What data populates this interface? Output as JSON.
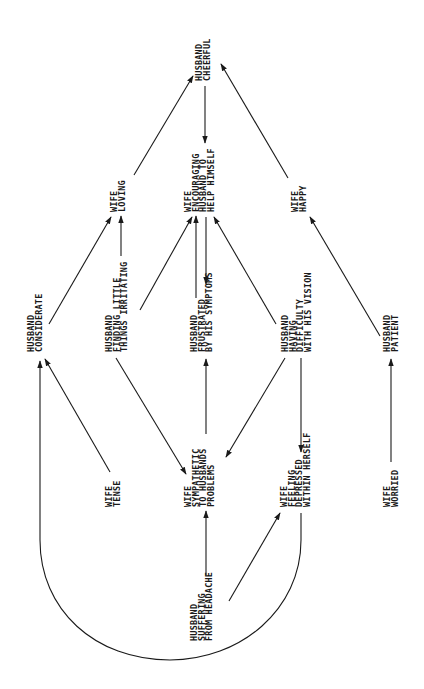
{
  "diagram": {
    "orientation": "rotated-90",
    "nodes": {
      "husband_cheerful": {
        "lines": [
          "HUSBAND",
          "CHEERFUL"
        ]
      },
      "wife_loving": {
        "lines": [
          "WIFE",
          "LOVING"
        ]
      },
      "wife_encouraging": {
        "lines": [
          "WIFE",
          "ENCOURAGING",
          "HUSBAND TO",
          "HELP HIMSELF"
        ]
      },
      "wife_happy": {
        "lines": [
          "WIFE",
          "HAPPY"
        ]
      },
      "husband_considerate": {
        "lines": [
          "HUSBAND",
          "CONSIDERATE"
        ]
      },
      "husband_finding": {
        "lines": [
          "HUSBAND",
          "FINDING LITTLE",
          "THINGS IRRITATING"
        ]
      },
      "husband_frustrated": {
        "lines": [
          "HUSBAND",
          "FRUSTRATED",
          "BY HIS SYMPTOMS"
        ]
      },
      "husband_having": {
        "lines": [
          "HUSBAND",
          "HAVING",
          "DIFFICULTY",
          "WITH HIS VISION"
        ]
      },
      "husband_patient": {
        "lines": [
          "HUSBAND",
          "PATIENT"
        ]
      },
      "wife_tense": {
        "lines": [
          "WIFE",
          "TENSE"
        ]
      },
      "wife_sympathetic": {
        "lines": [
          "WIFE",
          "SYMPATHETIC",
          "TO HUSBANDS",
          "PROBLEMS"
        ]
      },
      "wife_feeling": {
        "lines": [
          "WIFE",
          "FEELING",
          "DEPRESSED",
          "WITHIN HERSELF"
        ]
      },
      "wife_worried": {
        "lines": [
          "WIFE",
          "WORRIED"
        ]
      },
      "husband_suffering": {
        "lines": [
          "HUSBAND",
          "SUFFERING",
          "FROM HEADACHE"
        ]
      }
    },
    "edges": [
      {
        "from": "wife_loving",
        "to": "husband_cheerful"
      },
      {
        "from": "husband_cheerful",
        "to": "wife_encouraging"
      },
      {
        "from": "wife_happy",
        "to": "husband_cheerful"
      },
      {
        "from": "husband_considerate",
        "to": "wife_loving"
      },
      {
        "from": "husband_finding",
        "to": "wife_loving"
      },
      {
        "from": "husband_finding",
        "to": "wife_encouraging"
      },
      {
        "from": "husband_frustrated",
        "to": "wife_encouraging"
      },
      {
        "from": "wife_encouraging",
        "to": "husband_frustrated"
      },
      {
        "from": "husband_having",
        "to": "wife_encouraging"
      },
      {
        "from": "husband_patient",
        "to": "wife_happy"
      },
      {
        "from": "wife_tense",
        "to": "husband_considerate"
      },
      {
        "from": "wife_feeling",
        "to": "husband_considerate"
      },
      {
        "from": "husband_finding",
        "to": "wife_sympathetic"
      },
      {
        "from": "wife_sympathetic",
        "to": "husband_frustrated"
      },
      {
        "from": "husband_having",
        "to": "wife_sympathetic"
      },
      {
        "from": "husband_having",
        "to": "wife_feeling"
      },
      {
        "from": "wife_worried",
        "to": "husband_patient"
      },
      {
        "from": "husband_suffering",
        "to": "wife_sympathetic"
      },
      {
        "from": "husband_suffering",
        "to": "wife_feeling"
      }
    ],
    "colors": {
      "line": "#1a1a1a",
      "background": "#ffffff"
    }
  }
}
